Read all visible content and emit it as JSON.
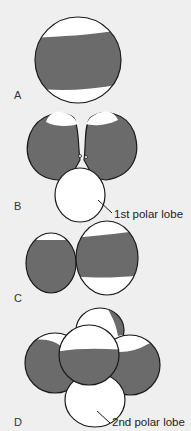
{
  "diagram": {
    "panels": [
      {
        "id": "A",
        "label": "A"
      },
      {
        "id": "B",
        "label": "B",
        "annotation": "1st polar lobe"
      },
      {
        "id": "C",
        "label": "C"
      },
      {
        "id": "D",
        "label": "D",
        "annotation": "2nd polar lobe"
      }
    ],
    "colors": {
      "background": "#efefef",
      "pigment_band": "#6b6b6b",
      "outline": "#1a1a1a",
      "cell_fill": "#ffffff"
    }
  }
}
